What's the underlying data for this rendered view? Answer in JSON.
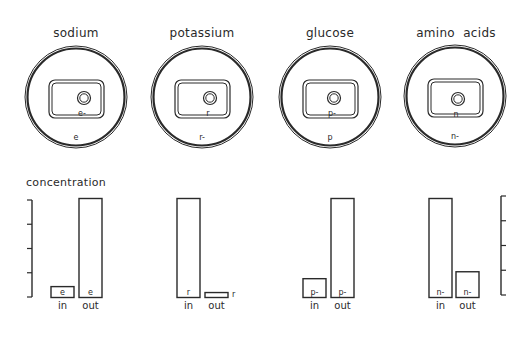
{
  "cells": [
    {
      "name": "sodium",
      "title": "sodium",
      "inside_label": "e-",
      "outside_label": "e",
      "center": [
        76,
        97
      ],
      "nucleus": [
        84,
        98
      ]
    },
    {
      "name": "potassium",
      "title": "potassium",
      "inside_label": "r",
      "outside_label": "r-",
      "center": [
        202,
        97
      ],
      "nucleus": [
        210,
        98
      ]
    },
    {
      "name": "glucose",
      "title": "glucose",
      "inside_label": "p-",
      "outside_label": "p",
      "center": [
        330,
        97
      ],
      "nucleus": [
        334,
        98
      ]
    },
    {
      "name": "amino-acids",
      "title": "amino  acids",
      "inside_label": "n",
      "outside_label": "n-",
      "center": [
        455,
        96
      ],
      "nucleus": [
        458,
        99
      ]
    }
  ],
  "axis": {
    "label": "concentration"
  },
  "chart_data": {
    "type": "bar",
    "title": "",
    "ylabel": "concentration",
    "xlabel": "",
    "categories": [
      "in",
      "out"
    ],
    "groups": [
      {
        "name": "sodium",
        "bar_labels": [
          "e",
          "e"
        ],
        "values": [
          11,
          100
        ]
      },
      {
        "name": "potassium",
        "bar_labels": [
          "r",
          "r"
        ],
        "values": [
          100,
          5
        ]
      },
      {
        "name": "glucose",
        "bar_labels": [
          "p-",
          "p-"
        ],
        "values": [
          19,
          100
        ]
      },
      {
        "name": "amino acids",
        "bar_labels": [
          "n-",
          "n-"
        ],
        "values": [
          100,
          26
        ]
      }
    ],
    "ylim": [
      0,
      100
    ],
    "ticks": 5,
    "grid": false
  },
  "bar_groups": [
    {
      "in_x": 51,
      "out_x": 79,
      "in_label": "in",
      "out_label": "out"
    },
    {
      "in_x": 177,
      "out_x": 205,
      "in_label": "in",
      "out_label": "out"
    },
    {
      "in_x": 303,
      "out_x": 331,
      "in_label": "in",
      "out_label": "out"
    },
    {
      "in_x": 429,
      "out_x": 456,
      "in_label": "in",
      "out_label": "out"
    }
  ]
}
